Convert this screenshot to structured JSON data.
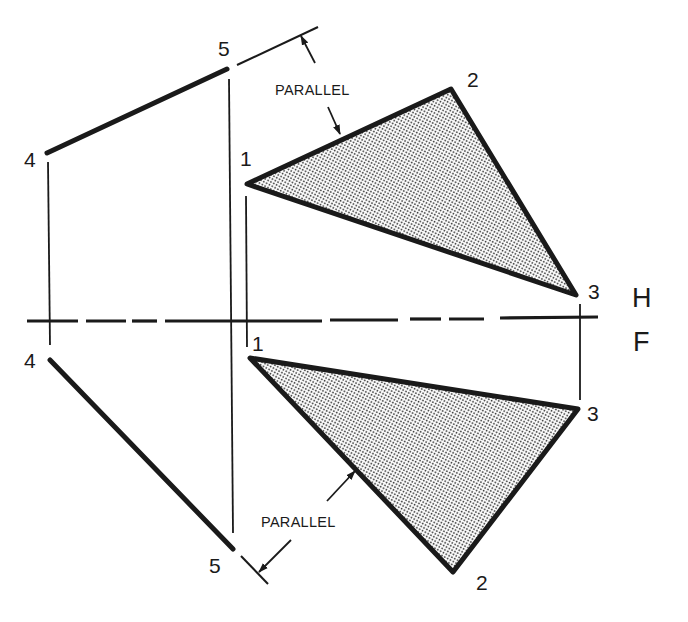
{
  "diagram": {
    "type": "orthographic-projection",
    "colors": {
      "ink": "#1a1a1a",
      "stipple_dot": "#3a3a3a",
      "background": "#ffffff"
    },
    "fold_line": {
      "upper_label": "H",
      "lower_label": "F"
    },
    "top_view": {
      "points": [
        {
          "id": "1",
          "label": "1"
        },
        {
          "id": "2",
          "label": "2"
        },
        {
          "id": "3",
          "label": "3"
        },
        {
          "id": "4",
          "label": "4"
        },
        {
          "id": "5",
          "label": "5"
        }
      ],
      "annotation": "PARALLEL"
    },
    "front_view": {
      "points": [
        {
          "id": "1",
          "label": "1"
        },
        {
          "id": "2",
          "label": "2"
        },
        {
          "id": "3",
          "label": "3"
        },
        {
          "id": "4",
          "label": "4"
        },
        {
          "id": "5",
          "label": "5"
        }
      ],
      "annotation": "PARALLEL"
    }
  }
}
